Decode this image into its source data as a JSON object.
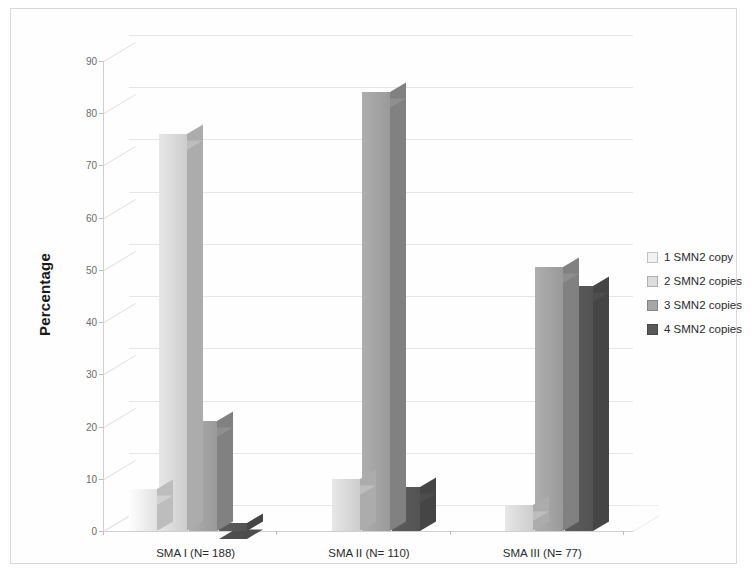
{
  "chart_data": {
    "type": "bar",
    "title": "",
    "xlabel": "",
    "ylabel": "Percentage",
    "ylim": [
      0,
      90
    ],
    "ytick_step": 10,
    "yticks": [
      0,
      10,
      20,
      30,
      40,
      50,
      60,
      70,
      80,
      90
    ],
    "grid": true,
    "legend_position": "right",
    "style": "3d-column",
    "categories": [
      "SMA I (N= 188)",
      "SMA II (N= 110)",
      "SMA III (N= 77)"
    ],
    "series": [
      {
        "name": "1 SMN2 copy",
        "color": "#f2f2f2",
        "values": [
          8,
          0,
          0
        ]
      },
      {
        "name": "2 SMN2 copies",
        "color": "#dcdcdc",
        "values": [
          76,
          10,
          5
        ]
      },
      {
        "name": "3 SMN2 copies",
        "color": "#a6a6a6",
        "values": [
          21,
          84,
          50.5
        ]
      },
      {
        "name": "4 SMN2 copies",
        "color": "#595959",
        "values": [
          1.5,
          8.5,
          47
        ]
      }
    ]
  },
  "axis": {
    "y_title": "Percentage",
    "tick_labels": [
      "90",
      "80",
      "70",
      "60",
      "50",
      "40",
      "30",
      "20",
      "10",
      "0"
    ]
  },
  "legend": {
    "items": [
      {
        "label": "1 SMN2 copy",
        "swatch": "#f2f2f2"
      },
      {
        "label": "2 SMN2 copies",
        "swatch": "#dcdcdc"
      },
      {
        "label": "3 SMN2 copies",
        "swatch": "#a6a6a6"
      },
      {
        "label": "4 SMN2 copies",
        "swatch": "#595959"
      }
    ]
  }
}
